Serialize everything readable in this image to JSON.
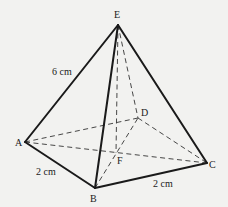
{
  "figure": {
    "type": "square-based pyramid",
    "vertices": {
      "E": {
        "label": "E",
        "x": 118,
        "y": 25
      },
      "A": {
        "label": "A",
        "x": 25,
        "y": 142
      },
      "B": {
        "label": "B",
        "x": 95,
        "y": 188
      },
      "C": {
        "label": "C",
        "x": 207,
        "y": 163
      },
      "D": {
        "label": "D",
        "x": 138,
        "y": 118
      },
      "F": {
        "label": "F",
        "x": 116,
        "y": 153
      }
    },
    "measurements": {
      "slant_edge_AE": "6 cm",
      "base_edge_AB": "2 cm",
      "base_edge_BC": "2 cm"
    },
    "visible_edges": [
      "EA",
      "EB",
      "EC",
      "AB",
      "BC"
    ],
    "hidden_edges": [
      "ED",
      "AD",
      "DC",
      "EF",
      "AC",
      "BD"
    ]
  }
}
